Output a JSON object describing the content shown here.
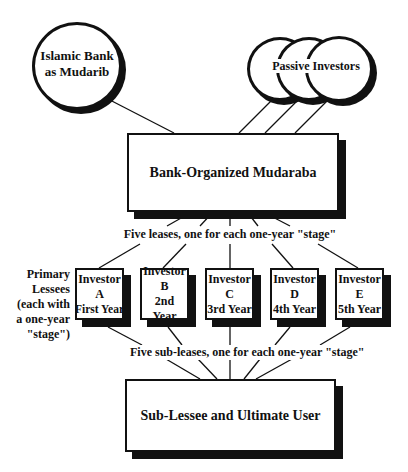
{
  "diagram": {
    "title": "",
    "nodes": {
      "bank": {
        "label_line1": "Islamic Bank",
        "label_line2": "as Mudarib",
        "shape": "circle"
      },
      "investors": {
        "label": "Passive Investors",
        "shape": "stacked-circles",
        "count": 3
      },
      "mudaraba": {
        "label": "Bank-Organized Mudaraba",
        "shape": "box"
      },
      "sublessee": {
        "label": "Sub-Lessee and Ultimate User",
        "shape": "box"
      }
    },
    "leases_caption": "Five leases, one for each one-year \"stage\"",
    "subleases_caption": "Five sub-leases, one for each one-year \"stage\"",
    "primary_lessees_label": {
      "line1": "Primary",
      "line2": "Lessees",
      "line3": "(each with",
      "line4": "a one-year",
      "line5": "\"stage\")"
    },
    "lessees": [
      {
        "line1": "Investor",
        "line2": "A",
        "line3": "First Year"
      },
      {
        "line1": "Investor",
        "line2": "B",
        "line3": "2nd Year"
      },
      {
        "line1": "Investor",
        "line2": "C",
        "line3": "3rd Year"
      },
      {
        "line1": "Investor",
        "line2": "D",
        "line3": "4th Year"
      },
      {
        "line1": "Investor",
        "line2": "E",
        "line3": "5th Year"
      }
    ]
  }
}
